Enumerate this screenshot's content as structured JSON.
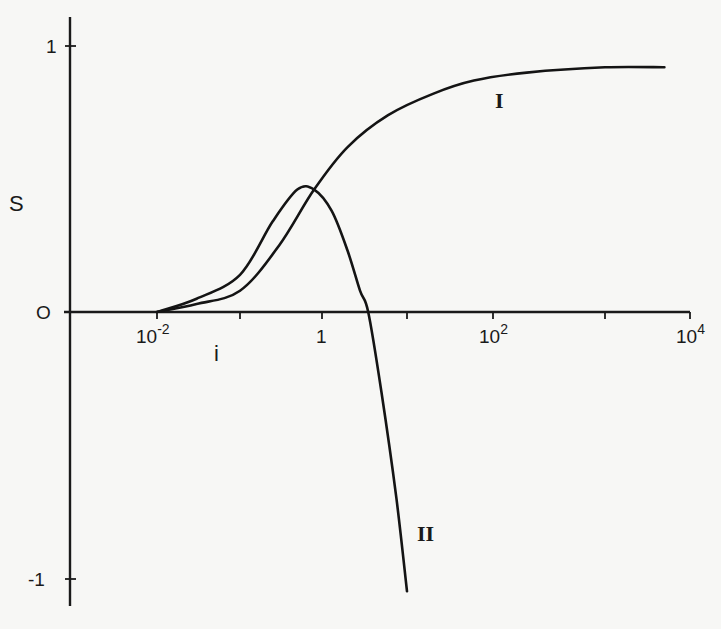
{
  "chart_data": {
    "type": "line",
    "title": "",
    "xlabel": "i",
    "ylabel": "S",
    "x_scale": "log",
    "xlim": [
      0.01,
      10000
    ],
    "ylim": [
      -1,
      1
    ],
    "grid": false,
    "legend": "none (curves labelled inline)",
    "x_ticks": [
      {
        "value": 0.01,
        "label_base": "10",
        "label_exp": "-2",
        "px": 157
      },
      {
        "value": 0.1,
        "label_base": "",
        "label_exp": "",
        "px": 240
      },
      {
        "value": 1,
        "label_base": "1",
        "label_exp": "",
        "px": 322
      },
      {
        "value": 10,
        "label_base": "",
        "label_exp": "",
        "px": 407
      },
      {
        "value": 100,
        "label_base": "10",
        "label_exp": "2",
        "px": 493
      },
      {
        "value": 1000,
        "label_base": "",
        "label_exp": "",
        "px": 605
      },
      {
        "value": 10000,
        "label_base": "10",
        "label_exp": "4",
        "px": 690
      }
    ],
    "y_ticks": [
      {
        "value": 1,
        "label": "1"
      },
      {
        "value": 0,
        "label": "O"
      },
      {
        "value": -1,
        "label": "-1"
      }
    ],
    "series": [
      {
        "name": "I",
        "description": "monotonically increasing, saturating toward S≈1",
        "points": [
          {
            "i": 0.01,
            "S": 0.0
          },
          {
            "i": 0.03,
            "S": 0.03
          },
          {
            "i": 0.1,
            "S": 0.08
          },
          {
            "i": 0.3,
            "S": 0.25
          },
          {
            "i": 0.8,
            "S": 0.46
          },
          {
            "i": 2,
            "S": 0.62
          },
          {
            "i": 6,
            "S": 0.74
          },
          {
            "i": 20,
            "S": 0.82
          },
          {
            "i": 60,
            "S": 0.87
          },
          {
            "i": 200,
            "S": 0.9
          },
          {
            "i": 1000,
            "S": 0.92
          },
          {
            "i": 5000,
            "S": 0.92
          }
        ]
      },
      {
        "name": "II",
        "description": "rises to a maximum S≈0.46 near i≈0.6, then falls steeply, crossing zero near i≈3.5 and reaching S≈-1.1",
        "points": [
          {
            "i": 0.01,
            "S": 0.0
          },
          {
            "i": 0.03,
            "S": 0.05
          },
          {
            "i": 0.1,
            "S": 0.14
          },
          {
            "i": 0.25,
            "S": 0.34
          },
          {
            "i": 0.5,
            "S": 0.46
          },
          {
            "i": 0.8,
            "S": 0.46
          },
          {
            "i": 1.3,
            "S": 0.38
          },
          {
            "i": 2.0,
            "S": 0.23
          },
          {
            "i": 2.8,
            "S": 0.08
          },
          {
            "i": 3.5,
            "S": 0.0
          },
          {
            "i": 5.0,
            "S": -0.3
          },
          {
            "i": 7.5,
            "S": -0.7
          },
          {
            "i": 10,
            "S": -1.05
          }
        ]
      }
    ]
  },
  "labels": {
    "y_axis": "S",
    "x_axis": "i",
    "curve_1": "I",
    "curve_2": "II",
    "x_tick_1e-2_base": "10",
    "x_tick_1e-2_exp": "-2",
    "x_tick_1": "1",
    "x_tick_1e2_base": "10",
    "x_tick_1e2_exp": "2",
    "x_tick_1e4_base": "10",
    "x_tick_1e4_exp": "4",
    "y_tick_1": "1",
    "y_tick_0": "O",
    "y_tick_m1": "-1"
  }
}
